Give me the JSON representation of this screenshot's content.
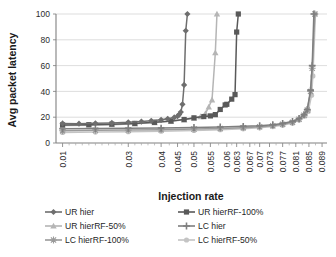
{
  "chart_data": {
    "type": "line",
    "title": "",
    "xlabel": "Injection rate",
    "ylabel": "Avg packet latency",
    "ylim": [
      0,
      100
    ],
    "yticks": [
      0,
      20,
      40,
      60,
      80,
      100
    ],
    "xlim": [
      0.008,
      0.0905
    ],
    "grid": "horizontal",
    "legend_position": "bottom",
    "xticks": [
      "0.01",
      "0.03",
      "0.04",
      "0.045",
      "0.05",
      "0.055",
      "0.06",
      "0.063",
      "0.067",
      "0.07",
      "0.073",
      "0.077",
      "0.081",
      "0.085",
      "0.089"
    ],
    "xtick_values": [
      0.01,
      0.03,
      0.04,
      0.045,
      0.05,
      0.055,
      0.06,
      0.063,
      0.067,
      0.07,
      0.073,
      0.077,
      0.081,
      0.085,
      0.089
    ],
    "series": [
      {
        "name": "UR hier",
        "color": "#6e6e6e",
        "marker": "diamond",
        "x": [
          0.01,
          0.015,
          0.02,
          0.025,
          0.03,
          0.034,
          0.037,
          0.04,
          0.042,
          0.044,
          0.045,
          0.0455,
          0.046,
          0.0465,
          0.047,
          0.0475,
          0.048
        ],
        "y": [
          15.2,
          15.0,
          15.3,
          15.6,
          16.0,
          16.6,
          17.2,
          18.0,
          18.8,
          19.8,
          20.8,
          22.0,
          24.0,
          30.0,
          45.0,
          87.0,
          100.0
        ]
      },
      {
        "name": "UR hierRF-100%",
        "color": "#595959",
        "marker": "square",
        "x": [
          0.01,
          0.018,
          0.025,
          0.032,
          0.038,
          0.043,
          0.047,
          0.05,
          0.053,
          0.055,
          0.0565,
          0.058,
          0.0595,
          0.06,
          0.0615,
          0.0625,
          0.063,
          0.0635
        ],
        "y": [
          14.0,
          14.2,
          14.6,
          15.2,
          16.0,
          17.0,
          18.2,
          19.5,
          20.5,
          21.0,
          22.0,
          26.0,
          29.5,
          30.0,
          34.0,
          37.5,
          86.0,
          100.0
        ]
      },
      {
        "name": "UR hierRF-50%",
        "color": "#b5b5b5",
        "marker": "triangle",
        "x": [
          0.01,
          0.018,
          0.025,
          0.032,
          0.038,
          0.043,
          0.047,
          0.05,
          0.052,
          0.0535,
          0.0545,
          0.0555,
          0.0565,
          0.057
        ],
        "y": [
          13.5,
          13.8,
          14.2,
          14.9,
          15.8,
          16.8,
          18.0,
          19.2,
          20.5,
          23.0,
          28.0,
          33.5,
          70.0,
          100.0
        ]
      },
      {
        "name": "LC hier",
        "color": "#7f7f7f",
        "marker": "cross",
        "x": [
          0.01,
          0.02,
          0.03,
          0.04,
          0.05,
          0.058,
          0.065,
          0.07,
          0.074,
          0.077,
          0.08,
          0.082,
          0.0835,
          0.0845,
          0.0855,
          0.086,
          0.0865
        ],
        "y": [
          11.0,
          11.2,
          11.4,
          11.6,
          12.0,
          12.4,
          12.9,
          13.4,
          14.2,
          15.2,
          16.8,
          19.0,
          22.0,
          26.0,
          41.0,
          60.0,
          100.0
        ]
      },
      {
        "name": "LC hierRF-100%",
        "color": "#9a9a9a",
        "marker": "star",
        "x": [
          0.01,
          0.02,
          0.03,
          0.04,
          0.05,
          0.058,
          0.065,
          0.07,
          0.074,
          0.077,
          0.08,
          0.082,
          0.0835,
          0.0845,
          0.0855,
          0.086,
          0.0868
        ],
        "y": [
          9.5,
          9.8,
          10.0,
          10.3,
          10.8,
          11.3,
          11.9,
          12.6,
          13.4,
          14.5,
          16.0,
          18.4,
          21.5,
          25.5,
          40.0,
          58.0,
          100.0
        ]
      },
      {
        "name": "LC hierRF-50%",
        "color": "#c4c4c4",
        "marker": "circle",
        "x": [
          0.01,
          0.02,
          0.03,
          0.04,
          0.05,
          0.058,
          0.065,
          0.07,
          0.074,
          0.077,
          0.08,
          0.082,
          0.0838,
          0.0848,
          0.0858,
          0.0862,
          0.087
        ],
        "y": [
          8.2,
          8.5,
          8.8,
          9.2,
          9.7,
          10.3,
          11.0,
          11.8,
          12.7,
          13.8,
          15.4,
          17.8,
          21.0,
          24.5,
          37.0,
          52.0,
          100.0
        ]
      }
    ]
  },
  "axis": {
    "xlabel": "Injection rate",
    "ylabel": "Avg packet latency"
  },
  "legend": {
    "items": [
      {
        "label": "UR hier"
      },
      {
        "label": "UR hierRF-100%"
      },
      {
        "label": "UR hierRF-50%"
      },
      {
        "label": "LC hier"
      },
      {
        "label": "LC hierRF-100%"
      },
      {
        "label": "LC hierRF-50%"
      }
    ]
  }
}
